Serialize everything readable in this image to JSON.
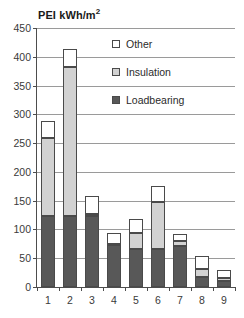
{
  "chart_data": {
    "type": "bar",
    "title_main": "PEI kWh/m",
    "title_sup": "2",
    "xlabel": "",
    "ylabel": "",
    "stacked": true,
    "grid": true,
    "legend_position": "inside-top-right",
    "ylim": [
      0,
      450
    ],
    "ytick_step": 50,
    "yticks": [
      0,
      50,
      100,
      150,
      200,
      250,
      300,
      350,
      400,
      450
    ],
    "ytick_labels": [
      "0",
      "50",
      "100",
      "150",
      "200",
      "250",
      "300",
      "350",
      "400",
      "450"
    ],
    "categories": [
      "1",
      "2",
      "3",
      "4",
      "5",
      "6",
      "7",
      "8",
      "9"
    ],
    "series": [
      {
        "name": "Loadbearing",
        "color": "#585858",
        "values": [
          123,
          123,
          123,
          73,
          66,
          66,
          71,
          17,
          10
        ]
      },
      {
        "name": "Insulation",
        "color": "#d2d2d2",
        "values": [
          136,
          259,
          4,
          2,
          28,
          82,
          9,
          14,
          5
        ]
      },
      {
        "name": "Other",
        "color": "#ffffff",
        "values": [
          30,
          31,
          31,
          19,
          25,
          27,
          12,
          23,
          15
        ]
      }
    ],
    "totals": [
      289,
      413,
      158,
      94,
      119,
      175,
      92,
      54,
      30
    ],
    "legend": [
      {
        "label": "Other",
        "color": "#ffffff"
      },
      {
        "label": "Insulation",
        "color": "#d2d2d2"
      },
      {
        "label": "Loadbearing",
        "color": "#585858"
      }
    ],
    "axis_color": "#4d4d4d",
    "grid_color": "#9a9a9a",
    "bar_border_color": "#4a4a4a"
  }
}
